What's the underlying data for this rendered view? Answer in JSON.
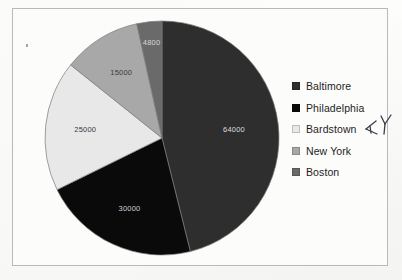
{
  "document": {
    "background_color": "#fbfbf9",
    "border_color": "#b9b9b9"
  },
  "annotation": {
    "text": "KY",
    "kind": "handwritten-pen-mark",
    "color": "#3a3a4a"
  },
  "legend": {
    "position": "right",
    "items": [
      {
        "label": "Baltimore",
        "color": "#2e2e2e"
      },
      {
        "label": "Philadelphia",
        "color": "#0a0a0a"
      },
      {
        "label": "Bardstown",
        "color": "#e8e8e8"
      },
      {
        "label": "New York",
        "color": "#a8a8a8"
      },
      {
        "label": "Boston",
        "color": "#6a6a6a"
      }
    ]
  },
  "chart_data": {
    "type": "pie",
    "title": "",
    "xlabel": "",
    "ylabel": "",
    "legend_position": "right",
    "grid": false,
    "total": 138800,
    "start_angle_deg": 0,
    "direction": "clockwise",
    "categories": [
      "Baltimore",
      "Philadelphia",
      "Bardstown",
      "New York",
      "Boston"
    ],
    "values": [
      64000,
      30000,
      25000,
      15000,
      4800
    ],
    "colors": [
      "#2e2e2e",
      "#0a0a0a",
      "#e8e8e8",
      "#a8a8a8",
      "#6a6a6a"
    ],
    "labels": [
      "64000",
      "30000",
      "25000",
      "15000",
      "4800"
    ],
    "label_colors": [
      "#dcdcdc",
      "#cfcfcf",
      "#3a3a3a",
      "#3a3a3a",
      "#d8d8d8"
    ],
    "slice_angles_deg": [
      165.9,
      77.8,
      64.8,
      38.9,
      12.4
    ]
  }
}
